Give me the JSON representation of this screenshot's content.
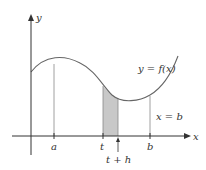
{
  "figure": {
    "axes": {
      "x_label": "x",
      "y_label": "y"
    },
    "curve_label": "y = f(x)",
    "vertical_line_label": "x = b",
    "tick_labels": {
      "a": "a",
      "t": "t",
      "t_plus_h": "t + h",
      "b": "b"
    },
    "colors": {
      "axis": "#333333",
      "curve": "#666666",
      "shade": "#c8c8c8",
      "guide": "#888888"
    }
  }
}
